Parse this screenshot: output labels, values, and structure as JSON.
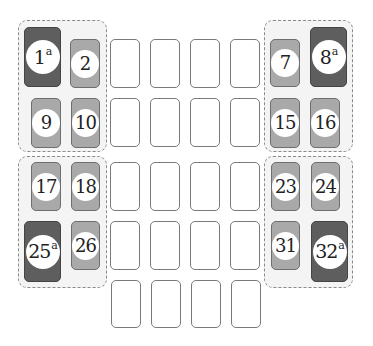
{
  "diagram": {
    "type": "fuse-box-layout",
    "colors": {
      "dark_fuse": "#5e5e5e",
      "light_fuse": "#a9a9a9",
      "empty_slot": "#ffffff",
      "group_bg": "#f4f4f4"
    },
    "groups": [
      {
        "id": "top-left",
        "fuses": [
          "1",
          "2",
          "9",
          "10"
        ]
      },
      {
        "id": "top-right",
        "fuses": [
          "7",
          "8",
          "15",
          "16"
        ]
      },
      {
        "id": "bottom-left",
        "fuses": [
          "17",
          "18",
          "25",
          "26"
        ]
      },
      {
        "id": "bottom-right",
        "fuses": [
          "23",
          "24",
          "31",
          "32"
        ]
      }
    ],
    "fuses": {
      "f1": {
        "number": "1",
        "sup": "a",
        "kind": "dark"
      },
      "f2": {
        "number": "2",
        "sup": "",
        "kind": "light"
      },
      "f7": {
        "number": "7",
        "sup": "",
        "kind": "light"
      },
      "f8": {
        "number": "8",
        "sup": "a",
        "kind": "dark"
      },
      "f9": {
        "number": "9",
        "sup": "",
        "kind": "light"
      },
      "f10": {
        "number": "10",
        "sup": "",
        "kind": "light"
      },
      "f15": {
        "number": "15",
        "sup": "",
        "kind": "light"
      },
      "f16": {
        "number": "16",
        "sup": "",
        "kind": "light"
      },
      "f17": {
        "number": "17",
        "sup": "",
        "kind": "light"
      },
      "f18": {
        "number": "18",
        "sup": "",
        "kind": "light"
      },
      "f23": {
        "number": "23",
        "sup": "",
        "kind": "light"
      },
      "f24": {
        "number": "24",
        "sup": "",
        "kind": "light"
      },
      "f25": {
        "number": "25",
        "sup": "a",
        "kind": "dark"
      },
      "f26": {
        "number": "26",
        "sup": "",
        "kind": "light"
      },
      "f31": {
        "number": "31",
        "sup": "",
        "kind": "light"
      },
      "f32": {
        "number": "32",
        "sup": "a",
        "kind": "dark"
      }
    },
    "empty_slots": {
      "rows": 5,
      "columns": 4
    }
  }
}
